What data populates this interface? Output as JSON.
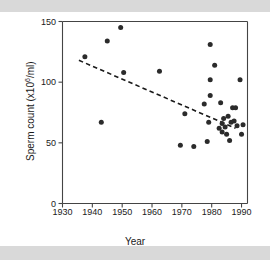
{
  "figure": {
    "background": "#ffffff",
    "band_color": "#d9d9d9",
    "axis_color": "#444444",
    "point_color": "#2b2b2b",
    "trend_color": "#1a1a1a"
  },
  "chart_data": {
    "type": "scatter",
    "title": "",
    "xlabel": "Year",
    "ylabel": "Sperm count (x10⁶/ml)",
    "ylabel_prefix": "Sperm count (x10",
    "ylabel_superscript": "6",
    "ylabel_suffix": "/ml)",
    "xlim": [
      1930,
      1992
    ],
    "ylim": [
      0,
      150
    ],
    "xticks": [
      1930,
      1940,
      1950,
      1960,
      1970,
      1980,
      1990
    ],
    "yticks": [
      0,
      50,
      100,
      150
    ],
    "grid": false,
    "legend": null,
    "marker": "filled-circle",
    "points": [
      {
        "x": 1937.5,
        "y": 121
      },
      {
        "x": 1943.0,
        "y": 67
      },
      {
        "x": 1945.0,
        "y": 134
      },
      {
        "x": 1949.5,
        "y": 145
      },
      {
        "x": 1950.5,
        "y": 108
      },
      {
        "x": 1962.5,
        "y": 109
      },
      {
        "x": 1969.5,
        "y": 48
      },
      {
        "x": 1971.0,
        "y": 74
      },
      {
        "x": 1974.0,
        "y": 47
      },
      {
        "x": 1977.5,
        "y": 82
      },
      {
        "x": 1978.5,
        "y": 51
      },
      {
        "x": 1979.0,
        "y": 67
      },
      {
        "x": 1979.5,
        "y": 89
      },
      {
        "x": 1979.5,
        "y": 102
      },
      {
        "x": 1979.5,
        "y": 131
      },
      {
        "x": 1981.0,
        "y": 114
      },
      {
        "x": 1982.5,
        "y": 62
      },
      {
        "x": 1983.0,
        "y": 83
      },
      {
        "x": 1983.5,
        "y": 66
      },
      {
        "x": 1983.5,
        "y": 59
      },
      {
        "x": 1984.0,
        "y": 70
      },
      {
        "x": 1984.5,
        "y": 63
      },
      {
        "x": 1985.0,
        "y": 57
      },
      {
        "x": 1985.5,
        "y": 72
      },
      {
        "x": 1986.0,
        "y": 52
      },
      {
        "x": 1986.5,
        "y": 67
      },
      {
        "x": 1987.0,
        "y": 79
      },
      {
        "x": 1987.5,
        "y": 68
      },
      {
        "x": 1988.0,
        "y": 79
      },
      {
        "x": 1988.5,
        "y": 64
      },
      {
        "x": 1989.5,
        "y": 102
      },
      {
        "x": 1990.0,
        "y": 57
      },
      {
        "x": 1990.5,
        "y": 65
      }
    ],
    "trend_line": {
      "style": "dashed",
      "x_start": 1935.5,
      "y_start": 118,
      "x_end": 1988.0,
      "y_end": 62
    }
  }
}
